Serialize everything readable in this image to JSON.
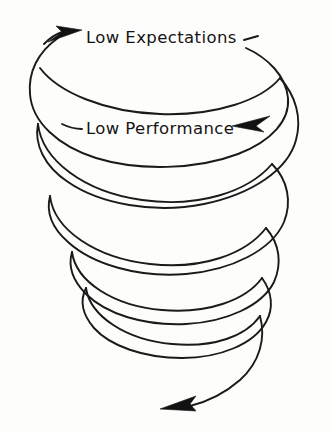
{
  "diagram": {
    "background_color": "#fdfdfc",
    "ink_color": "#1a1a1a",
    "stroke_width": 1.9,
    "labels": {
      "top": "Low Expectations",
      "middle": "Low Performance"
    },
    "arrows": {
      "top_arrow_name": "arrowhead-pointing-right",
      "middle_arrow_name": "arrowhead-pointing-left",
      "bottom_arrow_name": "arrowhead-pointing-down-left"
    },
    "loops": [
      {
        "name": "loop-1",
        "cy": 95,
        "rx": 124,
        "ry": 48
      },
      {
        "name": "loop-2",
        "cy": 175,
        "rx": 118,
        "ry": 45
      },
      {
        "name": "loop-3",
        "cy": 250,
        "rx": 100,
        "ry": 40
      },
      {
        "name": "loop-4",
        "cy": 325,
        "rx": 85,
        "ry": 37
      }
    ],
    "flow_direction": "counterclockwise-descending",
    "meaning": "self-reinforcing cycle in which low expectations produce low performance, which reinforces low expectations, spiralling downward"
  }
}
